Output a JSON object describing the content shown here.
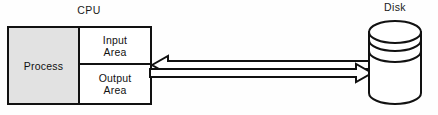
{
  "diagram": {
    "background_color": "#fefefe",
    "line_color": "#111111",
    "shaded_fill": "#e2e2e2",
    "white_fill": "#ffffff",
    "cpu": {
      "label": "CPU",
      "cells": {
        "process": "Process",
        "input_line1": "Input",
        "input_line2": "Area",
        "output_line1": "Output",
        "output_line2": "Area"
      }
    },
    "disk": {
      "label": "Disk",
      "platter_count": 3
    },
    "arrows": [
      {
        "name": "disk-to-cpu-arrow",
        "direction": "left",
        "style": "hollow-outline"
      },
      {
        "name": "cpu-to-disk-arrow",
        "direction": "right",
        "style": "hollow-outline"
      }
    ]
  }
}
